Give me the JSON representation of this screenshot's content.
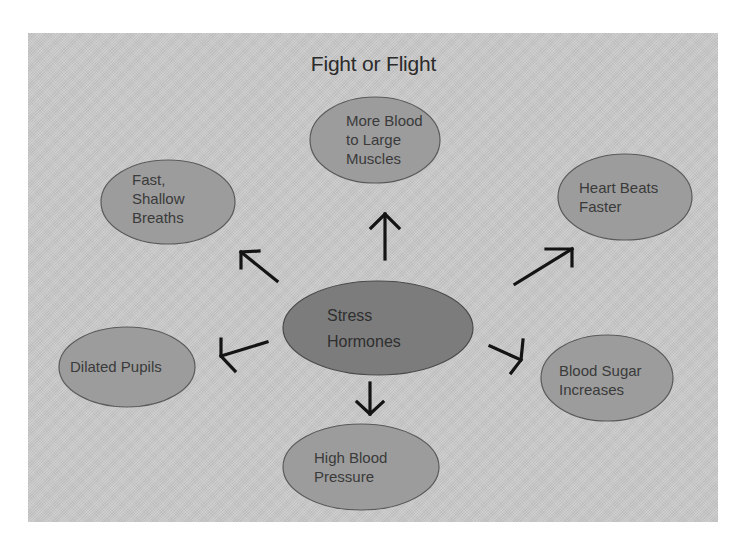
{
  "title": "Fight or Flight",
  "colors": {
    "background": "#c9c9c9",
    "center_node_fill": "#7c7c7c",
    "outer_node_fill": "#9c9c9c",
    "node_stroke": "#5a5a5a",
    "arrow": "#141414",
    "text": "#3a3a3a"
  },
  "center": {
    "label": "Stress\nHormones"
  },
  "effects": [
    {
      "id": "muscles",
      "label": "More Blood\nto Large\nMuscles",
      "direction": "up"
    },
    {
      "id": "breaths",
      "label": "Fast,\nShallow\nBreaths",
      "direction": "up-left"
    },
    {
      "id": "heart",
      "label": "Heart Beats\nFaster",
      "direction": "up-right"
    },
    {
      "id": "pupils",
      "label": "Dilated Pupils",
      "direction": "left"
    },
    {
      "id": "sugar",
      "label": "Blood Sugar\nIncreases",
      "direction": "down-right"
    },
    {
      "id": "pressure",
      "label": "High Blood\nPressure",
      "direction": "down"
    }
  ]
}
